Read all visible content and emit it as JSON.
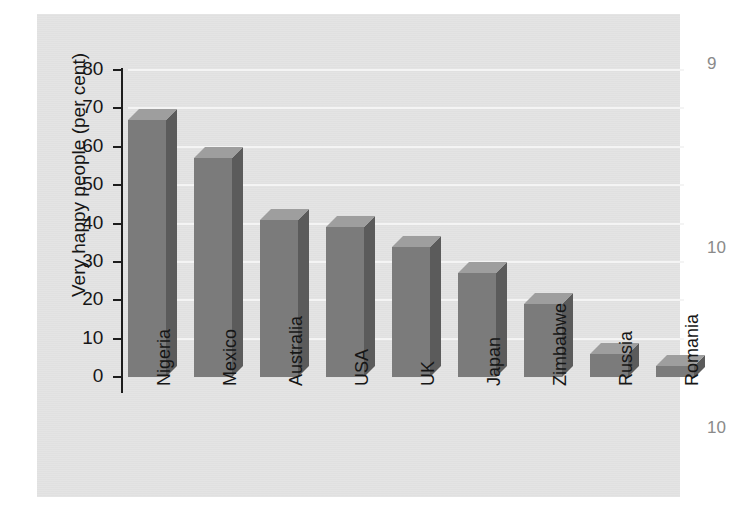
{
  "chart_data": {
    "type": "bar",
    "title": "",
    "xlabel": "",
    "ylabel": "Very happy people (per cent)",
    "ylim": [
      0,
      80
    ],
    "ytick_step": 10,
    "yticks": [
      "80",
      "70",
      "60",
      "50",
      "40",
      "30",
      "20",
      "10",
      "0"
    ],
    "grid": true,
    "grid_axis": "y",
    "legend": false,
    "style": "3d-bar",
    "categories": [
      "Nigeria",
      "Mexico",
      "Australia",
      "USA",
      "UK",
      "Japan",
      "Zimbabwe",
      "Russia",
      "Romania"
    ],
    "values": [
      67,
      57,
      41,
      39,
      34,
      27,
      19,
      6,
      3
    ],
    "bar_colors": {
      "front": "#7b7b7b",
      "top": "#9e9e9e",
      "side": "#5b5b5b"
    },
    "panel_background": "#e3e3e3",
    "gridline_color": "#f4f4f4",
    "axis_color": "#1d1d1d",
    "text_color": "#161616"
  },
  "margin_numbers": [
    {
      "text": "9",
      "top": 54
    },
    {
      "text": "10",
      "top": 238
    },
    {
      "text": "10",
      "top": 418
    }
  ]
}
